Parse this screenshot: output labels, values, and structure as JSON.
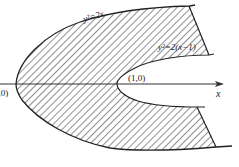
{
  "diagram": {
    "curves": [
      {
        "id": "outer",
        "equation": "y²=2x",
        "vertex": [
          0,
          0
        ]
      },
      {
        "id": "inner",
        "equation": "y²=2(x−1)",
        "vertex": [
          1,
          0
        ]
      }
    ],
    "labels": {
      "outer_curve": "y²=2x",
      "inner_curve": "y²=2(x−1)",
      "origin_point": "(0,0)",
      "inner_vertex_point": "(1,0)",
      "x_axis": "x"
    },
    "shading": "diagonal-hatch",
    "colors": {
      "line": "#222222",
      "hatch": "#333333",
      "background": "#ffffff"
    }
  }
}
